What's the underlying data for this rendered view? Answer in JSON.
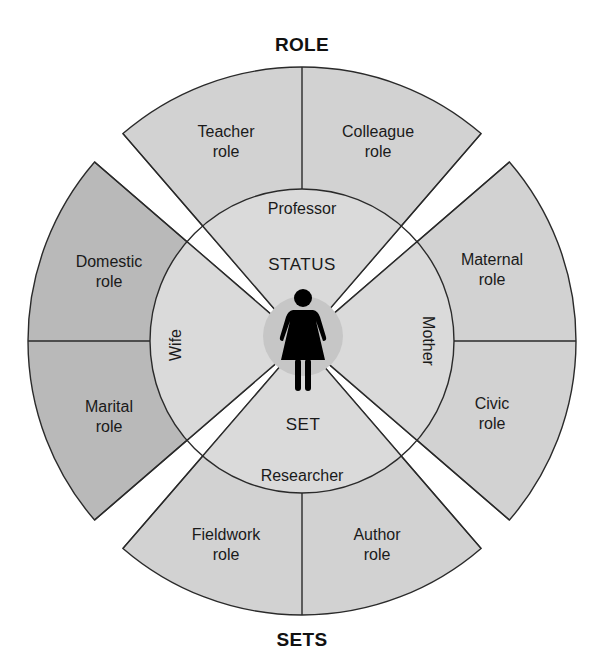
{
  "diagram": {
    "title_top": "ROLE",
    "title_bottom": "SETS",
    "center": {
      "label_top": "STATUS",
      "label_bottom": "SET",
      "figure": "woman-figure-icon"
    },
    "statuses": [
      {
        "label": "Professor",
        "position": "top"
      },
      {
        "label": "Mother",
        "position": "right"
      },
      {
        "label": "Researcher",
        "position": "bottom"
      },
      {
        "label": "Wife",
        "position": "left"
      }
    ],
    "roles": [
      {
        "status": "Professor",
        "label": "Teacher\nrole"
      },
      {
        "status": "Professor",
        "label": "Colleague\nrole"
      },
      {
        "status": "Mother",
        "label": "Maternal\nrole"
      },
      {
        "status": "Mother",
        "label": "Civic\nrole"
      },
      {
        "status": "Researcher",
        "label": "Fieldwork\nrole"
      },
      {
        "status": "Researcher",
        "label": "Author\nrole"
      },
      {
        "status": "Wife",
        "label": "Domestic\nrole"
      },
      {
        "status": "Wife",
        "label": "Marital\nrole"
      }
    ],
    "colors": {
      "sector_light": "#d2d2d2",
      "sector_dark": "#b9b9b9",
      "inner_circle": "#dadada",
      "center_halo": "#c6c6c6",
      "stroke": "#2a2a2a",
      "figure": "#000000"
    }
  }
}
